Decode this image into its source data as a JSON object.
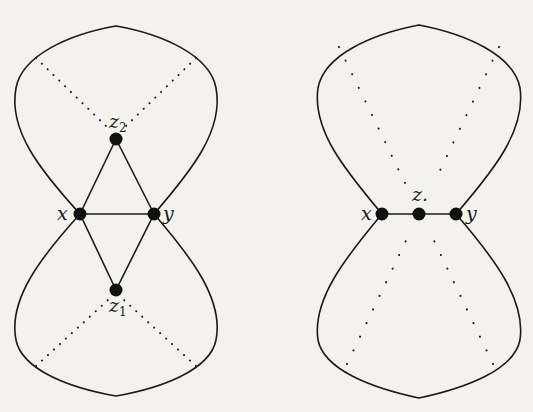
{
  "figure": {
    "background": "#f3f2ef",
    "ink": "#1a1a1a",
    "left_graph": {
      "nodes": [
        {
          "id": "x",
          "label": "x",
          "subscript": ""
        },
        {
          "id": "y",
          "label": "y",
          "subscript": ""
        },
        {
          "id": "z2",
          "label": "z",
          "subscript": "2"
        },
        {
          "id": "z1",
          "label": "z",
          "subscript": "1"
        }
      ],
      "edges": [
        [
          "x",
          "y"
        ],
        [
          "x",
          "z2"
        ],
        [
          "y",
          "z2"
        ],
        [
          "x",
          "z1"
        ],
        [
          "y",
          "z1"
        ]
      ]
    },
    "right_graph": {
      "nodes": [
        {
          "id": "x",
          "label": "x",
          "subscript": ""
        },
        {
          "id": "z",
          "label": "z.",
          "subscript": ""
        },
        {
          "id": "y",
          "label": "y",
          "subscript": ""
        }
      ],
      "edges": [
        [
          "x",
          "z"
        ],
        [
          "z",
          "y"
        ]
      ]
    }
  }
}
